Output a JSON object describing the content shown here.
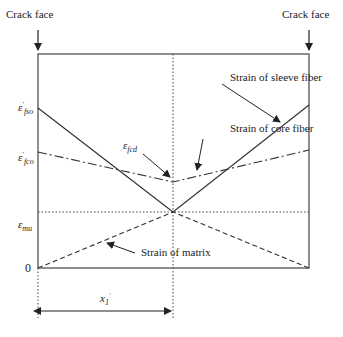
{
  "diagram": {
    "labels": {
      "crack_face_left": "Crack face",
      "crack_face_right": "Crack face",
      "sleeve_fiber": "Strain of sleeve fiber",
      "core_fiber": "Strain of core fiber",
      "matrix": "Strain of matrix",
      "efcd_symbol": "ε",
      "efcd_sub": "fcd"
    },
    "y_axis": {
      "efso_symbol": "ε",
      "efso_sup": "′",
      "efso_sub": "fso",
      "efco_symbol": "ε",
      "efco_sup": "′",
      "efco_sub": "fco",
      "emu_symbol": "ε",
      "emu_sub": "mu",
      "zero": "0"
    },
    "dimension": {
      "symbol": "x",
      "sub": "1",
      "sup": "′"
    },
    "line_styles": {
      "sleeve_fiber": "solid",
      "core_fiber": "dash-dot",
      "matrix": "dashed",
      "emu_level": "dotted",
      "midline": "dotted"
    }
  }
}
